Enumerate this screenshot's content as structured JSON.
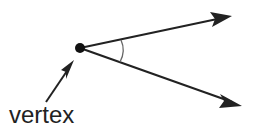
{
  "diagram": {
    "label": "vertex",
    "colors": {
      "stroke": "#222222",
      "background": "#ffffff",
      "arc": "#666666"
    },
    "vertex_point": {
      "x": 80,
      "y": 48
    },
    "rays": [
      {
        "name": "upper-ray",
        "tip": {
          "x": 232,
          "y": 16
        }
      },
      {
        "name": "lower-ray",
        "tip": {
          "x": 242,
          "y": 106
        }
      }
    ],
    "pointer_arrow": {
      "from": {
        "x": 46,
        "y": 102
      },
      "tip": {
        "x": 74,
        "y": 60
      }
    }
  }
}
